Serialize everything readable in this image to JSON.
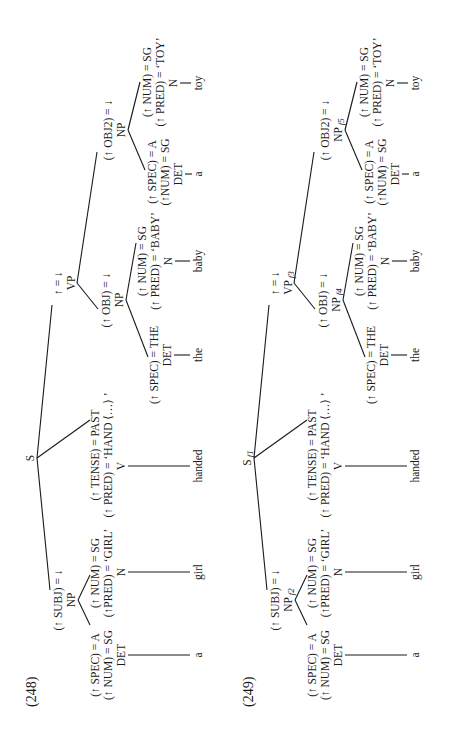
{
  "page": {
    "orientation": "rotated-90-ccw",
    "colors": {
      "ink": "#1a1a1a",
      "background": "#ffffff"
    }
  },
  "examples": [
    {
      "number": "(248)",
      "root": {
        "label": "S",
        "subscript": ""
      },
      "subj": {
        "annotation": "(↑ SUBJ) = ↓",
        "label": "NP",
        "subscript": "",
        "det": {
          "ann1": "(↑ SPEC) = A",
          "ann2": "(↑ NUM) = SG",
          "label": "DET",
          "word": "a"
        },
        "n": {
          "ann1": "(↑ NUM) = SG",
          "ann2": "(↑PRED) = ‘GIRL’",
          "label": "N",
          "word": "girl"
        }
      },
      "verb": {
        "ann1": "(↑ TENSE) = PAST",
        "ann2": "(↑ PRED) = ‘HAND ⟨…⟩ ’",
        "label": "V",
        "word": "handed"
      },
      "vp": {
        "annotation": "↑ = ↓",
        "label": "VP",
        "subscript": ""
      },
      "obj": {
        "annotation": "(↑ OBJ) = ↓",
        "label": "NP",
        "subscript": "",
        "det": {
          "ann1": "(↑ SPEC) = THE",
          "label": "DET",
          "word": "the"
        },
        "n": {
          "ann1": "(↑ NUM) = SG",
          "ann2": "(↑ PRED) = ‘BABY’",
          "label": "N",
          "word": "baby"
        }
      },
      "obj2": {
        "annotation": "(↑ OBJ2) = ↓",
        "label": "NP",
        "subscript": "",
        "det": {
          "ann1": "(↑ SPEC) = A",
          "ann2": "(↑NUM) = SG",
          "label": "DET",
          "word": "a"
        },
        "n": {
          "ann1": "(↑ NUM) = SG",
          "ann2": "(↑ PRED) = ‘TOY’",
          "label": "N",
          "word": "toy"
        }
      }
    },
    {
      "number": "(249)",
      "root": {
        "label": "S",
        "subscript": "f1"
      },
      "subj": {
        "annotation": "(↑ SUBJ) = ↓",
        "label": "NP",
        "subscript": "f2",
        "det": {
          "ann1": "(↑ SPEC) = A",
          "ann2": "(↑ NUM) = SG",
          "label": "DET",
          "word": "a"
        },
        "n": {
          "ann1": "(↑ NUM) = SG",
          "ann2": "(↑PRED) = ‘GIRL’",
          "label": "N",
          "word": "girl"
        }
      },
      "verb": {
        "ann1": "(↑ TENSE) = PAST",
        "ann2": "(↑ PRED) = ‘HAND ⟨…⟩ ’",
        "label": "V",
        "word": "handed"
      },
      "vp": {
        "annotation": "↑ = ↓",
        "label": "VP",
        "subscript": "f3"
      },
      "obj": {
        "annotation": "(↑ OBJ) = ↓",
        "label": "NP",
        "subscript": "f4",
        "det": {
          "ann1": "(↑ SPEC) = THE",
          "label": "DET",
          "word": "the"
        },
        "n": {
          "ann1": "(↑ NUM) = SG",
          "ann2": "(↑ PRED) = ‘BABY’",
          "label": "N",
          "word": "baby"
        }
      },
      "obj2": {
        "annotation": "(↑ OBJ2) = ↓",
        "label": "NP",
        "subscript": "f5",
        "det": {
          "ann1": "(↑ SPEC) = A",
          "ann2": "(↑NUM) = SG",
          "label": "DET",
          "word": "a"
        },
        "n": {
          "ann1": "(↑ NUM) = SG",
          "ann2": "(↑ PRED) = ‘TOY’",
          "label": "N",
          "word": "toy"
        }
      }
    }
  ]
}
